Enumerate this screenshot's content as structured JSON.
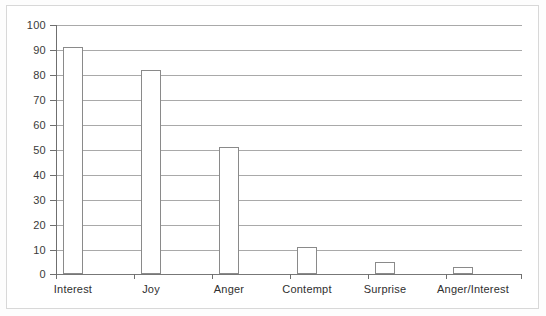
{
  "chart_data": {
    "type": "bar",
    "title": "",
    "subtitle": "",
    "xlabel": "",
    "ylabel": "",
    "categories": [
      "Interest",
      "Joy",
      "Anger",
      "Contempt",
      "Surprise",
      "Anger/Interest"
    ],
    "values": [
      91,
      82,
      51,
      11,
      5,
      3
    ],
    "ylim": [
      0,
      100
    ],
    "ytick_labels": [
      "0",
      "10",
      "20",
      "30",
      "40",
      "50",
      "60",
      "70",
      "80",
      "90",
      "100"
    ],
    "ytick_values": [
      0,
      10,
      20,
      30,
      40,
      50,
      60,
      70,
      80,
      90,
      100
    ],
    "grid": true,
    "legend": false,
    "legend_position": "none",
    "series": [
      {
        "name": "",
        "values": [
          91,
          82,
          51,
          11,
          5,
          3
        ]
      }
    ],
    "style": {
      "bar_fill": "#ffffff",
      "bar_border": "#8a8a8a",
      "gridline_color": "#a9a9a9",
      "axis_color": "#6f6f6f",
      "text_color": "#2f2f2f",
      "background": "#ffffff",
      "frame_color": "#d8d8d8"
    }
  }
}
